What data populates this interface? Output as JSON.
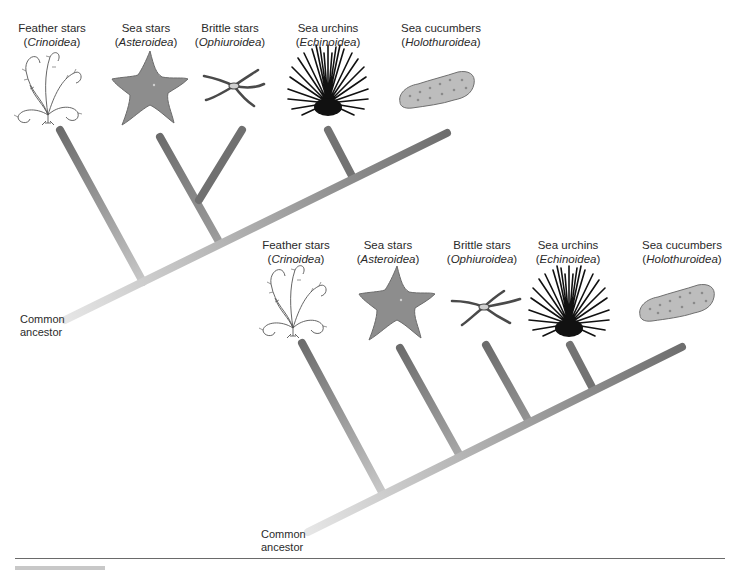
{
  "diagram_title": "Two equivalent phylogenetic trees of echinoderm classes",
  "top_tree": {
    "taxa": [
      {
        "common": "Feather stars",
        "scientific": "Crinoidea",
        "icon": "feather-star-illustration"
      },
      {
        "common": "Sea stars",
        "scientific": "Asteroidea",
        "icon": "sea-star-illustration"
      },
      {
        "common": "Brittle stars",
        "scientific": "Ophiuroidea",
        "icon": "brittle-star-illustration"
      },
      {
        "common": "Sea urchins",
        "scientific": "Echinoidea",
        "icon": "sea-urchin-illustration"
      },
      {
        "common": "Sea cucumbers",
        "scientific": "Holothuroidea",
        "icon": "sea-cucumber-illustration"
      }
    ],
    "root_label_line1": "Common",
    "root_label_line2": "ancestor"
  },
  "bottom_tree": {
    "taxa": [
      {
        "common": "Feather stars",
        "scientific": "Crinoidea",
        "icon": "feather-star-illustration"
      },
      {
        "common": "Sea stars",
        "scientific": "Asteroidea",
        "icon": "sea-star-illustration"
      },
      {
        "common": "Brittle stars",
        "scientific": "Ophiuroidea",
        "icon": "brittle-star-illustration"
      },
      {
        "common": "Sea urchins",
        "scientific": "Echinoidea",
        "icon": "sea-urchin-illustration"
      },
      {
        "common": "Sea cucumbers",
        "scientific": "Holothuroidea",
        "icon": "sea-cucumber-illustration"
      }
    ],
    "root_label_line1": "Common",
    "root_label_line2": "ancestor"
  },
  "colors": {
    "branch_dark": "#6e6e6e",
    "branch_light": "#e4e4e4",
    "sea_star": "#8a8a8a",
    "cucumber": "#b8b8b8",
    "urchin": "#111111"
  }
}
